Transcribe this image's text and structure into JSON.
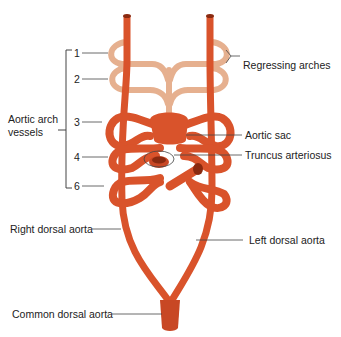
{
  "diagram": {
    "colors": {
      "artery": "#d9532b",
      "artery_dark": "#b53a1a",
      "artery_light": "#e8774f",
      "regressing": "#e6b08f",
      "regressing_dark": "#c98f6f",
      "leader": "#444444"
    },
    "left_group": {
      "label_line1": "Aortic arch",
      "label_line2": "vessels",
      "arch_numbers": [
        "1",
        "2",
        "3",
        "4",
        "6"
      ]
    },
    "labels": {
      "regressing_arches": "Regressing arches",
      "aortic_sac": "Aortic sac",
      "truncus_arteriosus": "Truncus arteriosus",
      "right_dorsal_aorta": "Right dorsal aorta",
      "left_dorsal_aorta": "Left dorsal aorta",
      "common_dorsal_aorta": "Common dorsal aorta"
    }
  }
}
